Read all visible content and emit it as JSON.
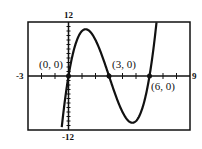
{
  "chart_data": {
    "type": "line",
    "title": "",
    "xlabel": "",
    "ylabel": "",
    "xlim": [
      -3,
      9
    ],
    "ylim": [
      -12,
      12
    ],
    "grid": false,
    "tick_labels": {
      "xmin": "-3",
      "xmax": "9",
      "ymax": "12",
      "ymin": "-12"
    },
    "function": "y = x(x-3)(x-6)",
    "series": [
      {
        "name": "f(x)",
        "x": [
          -0.5,
          0,
          0.5,
          1,
          1.27,
          1.5,
          2,
          2.5,
          3,
          3.5,
          4,
          4.5,
          4.73,
          5,
          5.5,
          6,
          6.5
        ],
        "values": [
          -12.4,
          0,
          6.9,
          10,
          10.4,
          10.1,
          8,
          4.4,
          0,
          -4.4,
          -8,
          -10.1,
          -10.4,
          -10,
          -6.9,
          0,
          12.4
        ]
      }
    ],
    "annotations": [
      {
        "label": "(0, 0)",
        "x": 0,
        "y": 0
      },
      {
        "label": "(3, 0)",
        "x": 3,
        "y": 0
      },
      {
        "label": "(6, 0)",
        "x": 6,
        "y": 0
      }
    ]
  }
}
